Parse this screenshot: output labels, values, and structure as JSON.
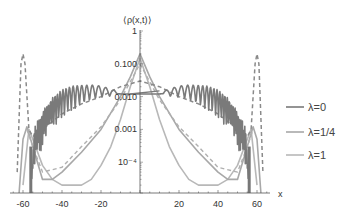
{
  "chart_data": {
    "type": "line",
    "title": "",
    "xlabel": "x",
    "ylabel": "⟨ρ(x,t)⟩",
    "xlim": [
      -65,
      65
    ],
    "ylim": [
      1e-05,
      1
    ],
    "yscale": "log",
    "x_ticks": [
      -60,
      -40,
      -20,
      20,
      40,
      60
    ],
    "y_ticks": [
      {
        "value": 1,
        "label": "1"
      },
      {
        "value": 0.1,
        "label": "0.100"
      },
      {
        "value": 0.01,
        "label": "0.010"
      },
      {
        "value": 0.001,
        "label": "0.001"
      },
      {
        "value": 0.0001,
        "label": "10⁻⁴"
      }
    ],
    "legend_position": "right",
    "series": [
      {
        "name": "λ=0",
        "color": "#7a7a7a",
        "style": "solid",
        "description": "Oscillating curve; flat ~0.012 near center, oscillations growing toward edges, sharp drop near |x|≈56",
        "x": [
          -56,
          -54,
          -50,
          -45,
          -40,
          -35,
          -30,
          -25,
          -20,
          -15,
          -10,
          -5,
          0,
          5,
          10,
          15,
          20,
          25,
          30,
          35,
          40,
          45,
          50,
          54,
          56
        ],
        "values": [
          1e-05,
          0.0003,
          0.001,
          0.003,
          0.006,
          0.009,
          0.011,
          0.013,
          0.014,
          0.013,
          0.012,
          0.012,
          0.012,
          0.012,
          0.012,
          0.013,
          0.014,
          0.013,
          0.011,
          0.009,
          0.006,
          0.003,
          0.001,
          0.0003,
          1e-05
        ]
      },
      {
        "name": "λ=1/4",
        "color": "#a8a8a8",
        "style": "solid",
        "description": "Sharp central peak ~0.2, exponential decay, minimum ~2e-5 near |x|≈50, secondary peak ~0.001 near |x|≈58",
        "x": [
          -62,
          -60,
          -58,
          -55,
          -50,
          -45,
          -40,
          -30,
          -20,
          -10,
          -5,
          0,
          5,
          10,
          20,
          30,
          40,
          45,
          50,
          55,
          58,
          60,
          62
        ],
        "values": [
          1e-05,
          0.0005,
          0.0012,
          0.0003,
          3e-05,
          3e-05,
          5e-05,
          0.0002,
          0.001,
          0.01,
          0.04,
          0.2,
          0.04,
          0.01,
          0.001,
          0.0002,
          5e-05,
          3e-05,
          3e-05,
          0.0003,
          0.0012,
          0.0005,
          1e-05
        ]
      },
      {
        "name": "λ=1",
        "color": "#b8b8b8",
        "style": "solid",
        "description": "Central peak ~0.15, steep decay to minimum ~2e-5 near |x|≈35, rising to ~0.001 near |x|≈57",
        "x": [
          -60,
          -57,
          -55,
          -50,
          -45,
          -40,
          -35,
          -30,
          -25,
          -20,
          -15,
          -10,
          -5,
          0,
          5,
          10,
          15,
          20,
          25,
          30,
          35,
          40,
          45,
          50,
          55,
          57,
          60
        ],
        "values": [
          2e-05,
          0.001,
          0.0005,
          8e-05,
          3e-05,
          2e-05,
          2e-05,
          2e-05,
          3e-05,
          8e-05,
          0.0003,
          0.002,
          0.02,
          0.15,
          0.02,
          0.002,
          0.0003,
          8e-05,
          3e-05,
          2e-05,
          2e-05,
          2e-05,
          3e-05,
          8e-05,
          0.0005,
          0.001,
          2e-05
        ]
      },
      {
        "name": "λ=0 envelope (dashed)",
        "color": "#8a8a8a",
        "style": "dashed",
        "description": "Dashed smooth curve; tall peak ~0.2 near |x|≈60, decaying to ~0.0005 near |x|≈55, rising to ~0.03 at center",
        "x": [
          -63,
          -61,
          -60,
          -59,
          -57,
          -55,
          -50,
          -40,
          -30,
          -20,
          -10,
          0,
          10,
          20,
          30,
          40,
          50,
          55,
          57,
          59,
          60,
          61,
          63
        ],
        "values": [
          5e-05,
          0.1,
          0.2,
          0.1,
          0.001,
          0.0006,
          0.001,
          0.003,
          0.006,
          0.01,
          0.02,
          0.03,
          0.02,
          0.01,
          0.006,
          0.003,
          0.001,
          0.0006,
          0.001,
          0.1,
          0.2,
          0.1,
          5e-05
        ]
      },
      {
        "name": "λ=1/4 envelope (dashed)",
        "color": "#b0b0b0",
        "style": "dashed",
        "description": "Dashed curve; exponential-like decay from center peak ~0.1, following λ=1/4",
        "x": [
          -58,
          -55,
          -50,
          -40,
          -30,
          -20,
          -10,
          0,
          10,
          20,
          30,
          40,
          50,
          55,
          58
        ],
        "values": [
          0.001,
          0.0003,
          5e-05,
          7e-05,
          0.0003,
          0.0012,
          0.008,
          0.1,
          0.008,
          0.0012,
          0.0003,
          7e-05,
          5e-05,
          0.0003,
          0.001
        ]
      }
    ]
  },
  "legend": {
    "items": [
      {
        "label": "λ=0",
        "color": "#7a7a7a"
      },
      {
        "label": "λ=1/4",
        "color": "#a8a8a8"
      },
      {
        "label": "λ=1",
        "color": "#b8b8b8"
      }
    ]
  },
  "axes": {
    "x_label": "x",
    "y_label": "⟨ρ(x,t)⟩",
    "x_tick_labels": [
      "-60",
      "-40",
      "-20",
      "20",
      "40",
      "60"
    ],
    "y_tick_labels": [
      "1",
      "0.100",
      "0.010",
      "0.001",
      "10⁻⁴"
    ]
  }
}
